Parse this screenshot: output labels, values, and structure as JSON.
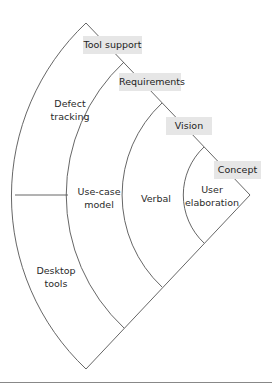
{
  "diagram": {
    "type": "concentric-sector",
    "tags": [
      {
        "label": "Tool support"
      },
      {
        "label": "Requirements"
      },
      {
        "label": "Vision"
      },
      {
        "label": "Concept"
      }
    ],
    "bands": [
      {
        "name": "tool-support",
        "labels": [
          "Defect\ntracking",
          "Desktop\ntools"
        ]
      },
      {
        "name": "requirements",
        "labels": [
          "Use-case\nmodel"
        ]
      },
      {
        "name": "vision",
        "labels": [
          "Verbal"
        ]
      },
      {
        "name": "concept",
        "labels": [
          "User\nelaboration"
        ]
      }
    ]
  }
}
